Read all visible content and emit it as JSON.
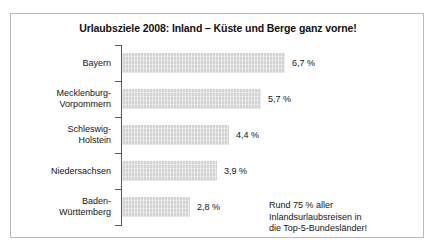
{
  "chart_data": {
    "type": "bar",
    "orientation": "horizontal",
    "title": "Urlaubsziele 2008: Inland – Küste und Berge ganz vorne!",
    "xlabel": "",
    "ylabel": "",
    "grid": false,
    "legend": null,
    "xlim": [
      0,
      8.2
    ],
    "categories": [
      "Bayern",
      "Mecklenburg-Vorpommern",
      "Schleswig-Holstein",
      "Niedersachsen",
      "Baden-Württemberg"
    ],
    "category_lines": [
      [
        "Bayern"
      ],
      [
        "Mecklenburg-",
        "Vorpommern"
      ],
      [
        "Schleswig-",
        "Holstein"
      ],
      [
        "Niedersachsen"
      ],
      [
        "Baden-",
        "Württemberg"
      ]
    ],
    "values": [
      6.7,
      5.7,
      4.4,
      3.9,
      2.8
    ],
    "value_labels": [
      "6,7 %",
      "5,7 %",
      "4,4 %",
      "3,9 %",
      "2,8 %"
    ],
    "annotation_lines": [
      "Rund 75 % aller",
      "Inlandsurlaubsreisen in",
      "die Top-5-Bundesländer!"
    ],
    "colors": {
      "bar_fill": "#d2d2d2",
      "axis": "#5a5a5a",
      "frame": "#b9b9b9",
      "text": "#141414",
      "background": "#ffffff"
    }
  }
}
